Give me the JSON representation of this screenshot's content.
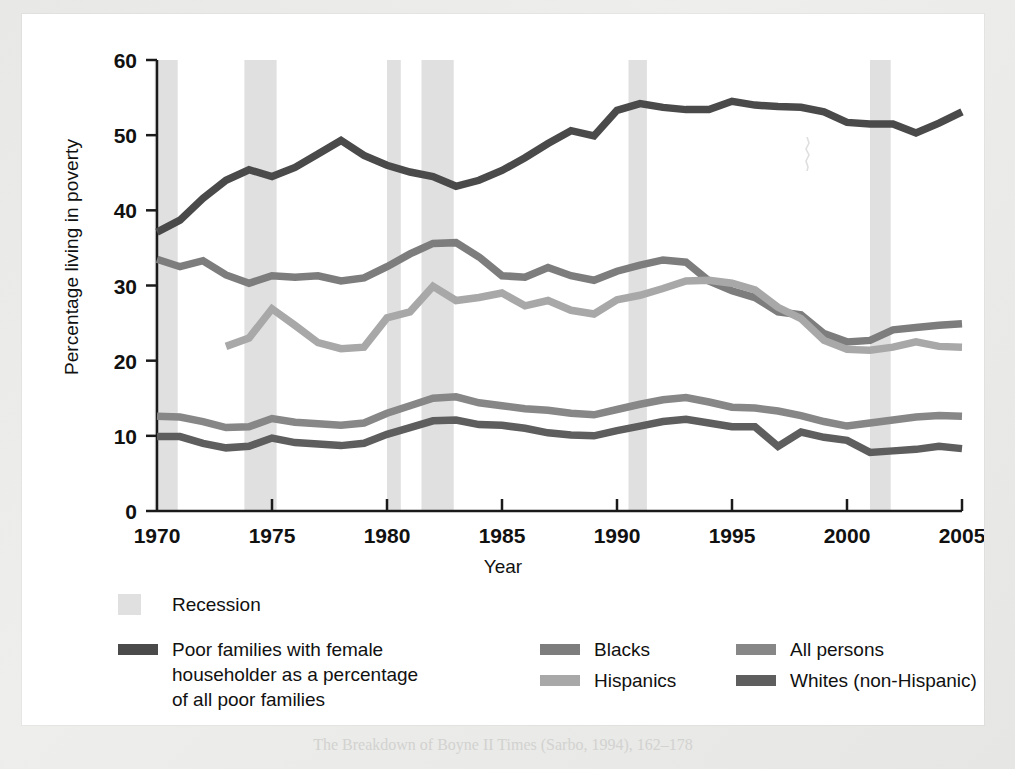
{
  "figure": {
    "background_color": "#ffffff",
    "page_background_color": "#e9e9e7"
  },
  "caption": {
    "text": "The Breakdown of Boyne II Times (Sarbo, 1994), 162–178"
  },
  "legend": {
    "recession_label": "Recession",
    "entries": [
      {
        "key": "poor-female-householder",
        "label": "Poor families with female\nhouseholder as a percentage\nof all poor families",
        "color": "#4a4a4a"
      },
      {
        "key": "blacks",
        "label": "Blacks",
        "color": "#7d7d7d"
      },
      {
        "key": "hispanics",
        "label": "Hispanics",
        "color": "#a8a8a8"
      },
      {
        "key": "all-persons",
        "label": "All persons",
        "color": "#878787"
      },
      {
        "key": "whites-non-hispanic",
        "label": "Whites (non-Hispanic)",
        "color": "#5e5e5e"
      }
    ],
    "recession_color": "#e0e0e0"
  },
  "chart_data": {
    "type": "line",
    "title": "",
    "xlabel": "Year",
    "ylabel": "Percentage living in poverty",
    "xlim": [
      1970,
      2005
    ],
    "ylim": [
      0,
      60
    ],
    "yticks": [
      0,
      10,
      20,
      30,
      40,
      50,
      60
    ],
    "xticks": [
      1970,
      1975,
      1980,
      1985,
      1990,
      1995,
      2000,
      2005
    ],
    "grid": false,
    "legend_position": "below",
    "x": [
      1970,
      1971,
      1972,
      1973,
      1974,
      1975,
      1976,
      1977,
      1978,
      1979,
      1980,
      1981,
      1982,
      1983,
      1984,
      1985,
      1986,
      1987,
      1988,
      1989,
      1990,
      1991,
      1992,
      1993,
      1994,
      1995,
      1996,
      1997,
      1998,
      1999,
      2000,
      2001,
      2002,
      2003,
      2004,
      2005
    ],
    "series": [
      {
        "name": "Poor families with female householder as a percentage of all poor families",
        "key": "poor-female-householder",
        "color": "#4a4a4a",
        "values": [
          37.1,
          38.7,
          41.6,
          44.0,
          45.4,
          44.5,
          45.7,
          47.5,
          49.3,
          47.3,
          46.0,
          45.1,
          44.5,
          43.2,
          44.0,
          45.3,
          47.0,
          48.9,
          50.6,
          49.9,
          53.3,
          54.2,
          53.7,
          53.4,
          53.4,
          54.5,
          54.0,
          53.8,
          53.7,
          53.1,
          51.7,
          51.5,
          51.5,
          50.3,
          51.6,
          53.1
        ]
      },
      {
        "name": "Blacks",
        "key": "blacks",
        "color": "#7d7d7d",
        "values": [
          33.5,
          32.5,
          33.3,
          31.4,
          30.3,
          31.3,
          31.1,
          31.3,
          30.6,
          31.0,
          32.5,
          34.2,
          35.6,
          35.7,
          33.8,
          31.3,
          31.1,
          32.4,
          31.3,
          30.7,
          31.9,
          32.7,
          33.4,
          33.1,
          30.6,
          29.3,
          28.4,
          26.5,
          26.1,
          23.6,
          22.5,
          22.7,
          24.1,
          24.4,
          24.7,
          24.9
        ]
      },
      {
        "name": "Hispanics",
        "key": "hispanics",
        "color": "#a8a8a8",
        "values": [
          null,
          null,
          null,
          21.9,
          23.0,
          26.9,
          24.7,
          22.4,
          21.6,
          21.8,
          25.7,
          26.5,
          29.9,
          28.0,
          28.4,
          29.0,
          27.3,
          28.0,
          26.7,
          26.2,
          28.1,
          28.7,
          29.6,
          30.6,
          30.7,
          30.3,
          29.4,
          27.1,
          25.6,
          22.7,
          21.5,
          21.4,
          21.8,
          22.5,
          21.9,
          21.8
        ]
      },
      {
        "name": "All persons",
        "key": "all-persons",
        "color": "#878787",
        "values": [
          12.6,
          12.5,
          11.9,
          11.1,
          11.2,
          12.3,
          11.8,
          11.6,
          11.4,
          11.7,
          13.0,
          14.0,
          15.0,
          15.2,
          14.4,
          14.0,
          13.6,
          13.4,
          13.0,
          12.8,
          13.5,
          14.2,
          14.8,
          15.1,
          14.5,
          13.8,
          13.7,
          13.3,
          12.7,
          11.9,
          11.3,
          11.7,
          12.1,
          12.5,
          12.7,
          12.6
        ]
      },
      {
        "name": "Whites (non-Hispanic)",
        "key": "whites-non-hispanic",
        "color": "#5e5e5e",
        "values": [
          9.9,
          9.9,
          9.0,
          8.4,
          8.6,
          9.7,
          9.1,
          8.9,
          8.7,
          9.0,
          10.2,
          11.1,
          12.0,
          12.1,
          11.5,
          11.4,
          11.0,
          10.4,
          10.1,
          10.0,
          10.7,
          11.3,
          11.9,
          12.2,
          11.7,
          11.2,
          11.2,
          8.6,
          10.5,
          9.8,
          9.4,
          7.8,
          8.0,
          8.2,
          8.6,
          8.3
        ]
      }
    ],
    "recessions": [
      {
        "start": 1969.9,
        "end": 1970.9
      },
      {
        "start": 1973.8,
        "end": 1975.2
      },
      {
        "start": 1980.0,
        "end": 1980.6
      },
      {
        "start": 1981.5,
        "end": 1982.9
      },
      {
        "start": 1990.5,
        "end": 1991.3
      },
      {
        "start": 2001.0,
        "end": 2001.9
      }
    ]
  }
}
